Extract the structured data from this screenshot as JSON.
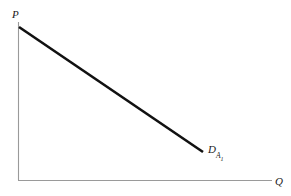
{
  "figure": {
    "background_color": "#ffffff",
    "width": 291,
    "height": 196
  },
  "axes": {
    "y_label": "P",
    "x_label": "Q",
    "axis_color": "#9a9a9a",
    "origin": {
      "x": 18,
      "y": 180
    },
    "y_axis_top": 22,
    "x_axis_right": 272
  },
  "curve": {
    "label_main": "D",
    "label_sub": "A",
    "label_subsub": "1",
    "color": "#111111",
    "width": 2.6,
    "start": {
      "x": 19,
      "y": 27
    },
    "end": {
      "x": 203,
      "y": 152
    }
  },
  "chart_data": {
    "type": "line",
    "title": "",
    "xlabel": "Q",
    "ylabel": "P",
    "grid": false,
    "legend": "inline-label",
    "xlim": [
      0,
      1
    ],
    "ylim": [
      0,
      1
    ],
    "series": [
      {
        "name": "D_A1",
        "label": "D",
        "label_subscript": "A1",
        "color": "#111111",
        "linewidth": 2.6,
        "x": [
          0.004,
          0.728
        ],
        "y": [
          0.968,
          0.177
        ],
        "x_pixels": [
          19,
          203
        ],
        "y_pixels": [
          27,
          152
        ],
        "description": "Downward-sloping linear demand curve for good A, labeled D with subscript A-sub-1"
      }
    ],
    "annotations": [
      {
        "text": "P",
        "role": "y-axis-label",
        "x_pixels": 13,
        "y_pixels": 14,
        "italic": true
      },
      {
        "text": "Q",
        "role": "x-axis-label",
        "x_pixels": 277,
        "y_pixels": 182,
        "italic": true
      },
      {
        "text": "D_A1",
        "role": "curve-label",
        "x_pixels": 209,
        "y_pixels": 150,
        "italic": true
      }
    ]
  }
}
